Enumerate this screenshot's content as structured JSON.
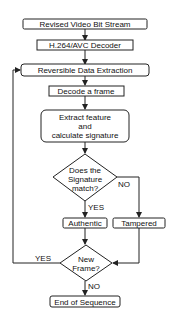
{
  "diagram": {
    "nodes": {
      "input": "Revised Video Bit Stream",
      "decoder": "H.264/AVC Decoder",
      "extraction": "Reversible Data Extraction",
      "decode_frame": "Decode a frame",
      "extract_line1": "Extract feature",
      "extract_line2": "and",
      "extract_line3": "calculate signature",
      "match_line1": "Does the",
      "match_line2": "Signature",
      "match_line3": "match?",
      "authentic": "Authentic",
      "tampered": "Tampered",
      "newframe_line1": "New",
      "newframe_line2": "Frame?",
      "end": "End of Sequence"
    },
    "labels": {
      "match_yes": "YES",
      "match_no": "NO",
      "newframe_yes": "YES",
      "newframe_no": "NO"
    },
    "colors": {
      "stroke": "#222222",
      "fill": "#ffffff",
      "text": "#111111"
    }
  }
}
